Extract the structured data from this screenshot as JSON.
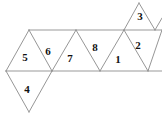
{
  "figure": {
    "type": "polyhedron-net",
    "width": 162,
    "height": 121,
    "background_color": "#ffffff",
    "line_color": "#8a8a8a",
    "label_color": "#111111"
  },
  "geometry": {
    "top_line_y": 30,
    "middle_line_y": 71,
    "bottom_vertex_y": 112,
    "top_vertices_x": [
      29,
      76,
      114,
      162
    ],
    "middle_vertices_x": [
      6,
      52,
      100,
      148
    ],
    "edge_half_width": 23,
    "row_height": 41
  },
  "faces": [
    {
      "id": "face-5",
      "label": "5",
      "orientation": "up",
      "x": 25,
      "y": 57
    },
    {
      "id": "face-6",
      "label": "6",
      "orientation": "down",
      "x": 48,
      "y": 51
    },
    {
      "id": "face-7",
      "label": "7",
      "orientation": "up",
      "x": 70,
      "y": 58
    },
    {
      "id": "face-8",
      "label": "8",
      "orientation": "down",
      "x": 95,
      "y": 47
    },
    {
      "id": "face-1",
      "label": "1",
      "orientation": "up",
      "x": 118,
      "y": 59
    },
    {
      "id": "face-2",
      "label": "2",
      "orientation": "down",
      "x": 138,
      "y": 45
    },
    {
      "id": "face-3",
      "label": "3",
      "orientation": "up",
      "x": 140,
      "y": 16
    },
    {
      "id": "face-4",
      "label": "4",
      "orientation": "down",
      "x": 27,
      "y": 89
    }
  ],
  "edges": [
    {
      "name": "top-horizontal",
      "x1": 29,
      "y1": 30,
      "x2": 162,
      "y2": 30
    },
    {
      "name": "middle-horizontal",
      "x1": 6,
      "y1": 71,
      "x2": 162,
      "y2": 71
    },
    {
      "name": "e-5-left",
      "x1": 29,
      "y1": 30,
      "x2": 6,
      "y2": 71
    },
    {
      "name": "e-5-right",
      "x1": 29,
      "y1": 30,
      "x2": 52,
      "y2": 71
    },
    {
      "name": "e-6-right",
      "x1": 76,
      "y1": 30,
      "x2": 52,
      "y2": 71
    },
    {
      "name": "e-7-right",
      "x1": 76,
      "y1": 30,
      "x2": 100,
      "y2": 71
    },
    {
      "name": "e-8-right",
      "x1": 124,
      "y1": 30,
      "x2": 100,
      "y2": 71
    },
    {
      "name": "e-1-right",
      "x1": 124,
      "y1": 30,
      "x2": 148,
      "y2": 71
    },
    {
      "name": "e-2-right",
      "x1": 162,
      "y1": 30,
      "x2": 148,
      "y2": 71
    },
    {
      "name": "e-3-left",
      "x1": 124,
      "y1": 30,
      "x2": 139,
      "y2": 3
    },
    {
      "name": "e-3-right",
      "x1": 139,
      "y1": 3,
      "x2": 155,
      "y2": 30
    },
    {
      "name": "e-3-far-right",
      "x1": 155,
      "y1": 30,
      "x2": 162,
      "y2": 18
    },
    {
      "name": "e-4-left",
      "x1": 6,
      "y1": 71,
      "x2": 29,
      "y2": 112
    },
    {
      "name": "e-4-right",
      "x1": 52,
      "y1": 71,
      "x2": 29,
      "y2": 112
    }
  ]
}
